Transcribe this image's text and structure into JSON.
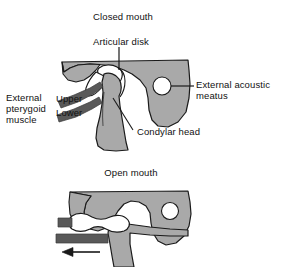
{
  "figure": {
    "title_top": "Closed mouth",
    "title_bottom": "Open mouth",
    "background_color": "#ffffff",
    "bone_fill_color": "#a9a9a9",
    "muscle_fill_color": "#595959",
    "disk_fill_color": "#ffffff",
    "meatus_fill_color": "#ffffff",
    "outline_color": "#1a1a1a",
    "leader_line_color": "#1a1a1a",
    "text_color": "#111111"
  },
  "labels": {
    "closed_mouth": "Closed mouth",
    "articular_disk": "Articular disk",
    "external_acoustic_meatus_line1": "External acoustic",
    "external_acoustic_meatus_line2": "meatus",
    "external_pterygoid_line1": "External",
    "external_pterygoid_line2": "pterygoid",
    "external_pterygoid_line3": "muscle",
    "upper": "Upper",
    "lower": "Lower",
    "condylar_head": "Condylar head",
    "open_mouth": "Open mouth"
  },
  "panels": [
    {
      "name": "closed-mouth-panel",
      "title": "Closed mouth",
      "annotations": [
        "Articular disk",
        "External acoustic meatus",
        "External pterygoid muscle",
        "Upper",
        "Lower",
        "Condylar head"
      ]
    },
    {
      "name": "open-mouth-panel",
      "title": "Open mouth",
      "annotations": [
        "translation-arrow"
      ]
    }
  ]
}
